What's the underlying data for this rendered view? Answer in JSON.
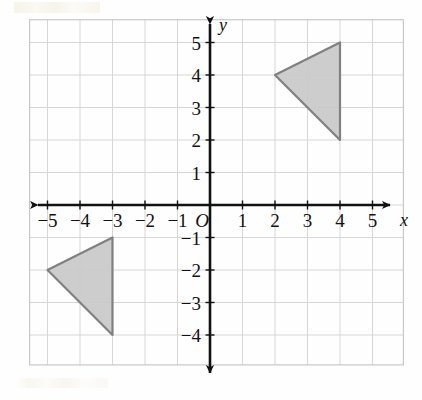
{
  "figure": {
    "type": "coordinate-grid"
  },
  "chart_data": {
    "type": "scatter",
    "title": "",
    "subtitle": "",
    "xlabel": "x",
    "ylabel": "y",
    "origin_label": "O",
    "xlim": [
      -5.5,
      5.8
    ],
    "ylim": [
      -4.9,
      5.6
    ],
    "grid": true,
    "grid_step": 1,
    "legend": null,
    "x_ticks": [
      -5,
      -4,
      -3,
      -2,
      -1,
      1,
      2,
      3,
      4,
      5
    ],
    "y_ticks": [
      5,
      4,
      3,
      2,
      1,
      -1,
      -2,
      -3,
      -4
    ],
    "x_tick_labels": [
      "−5",
      "−4",
      "−3",
      "−2",
      "−1",
      "1",
      "2",
      "3",
      "4",
      "5"
    ],
    "y_tick_labels": [
      "5",
      "4",
      "3",
      "2",
      "1",
      "−1",
      "−2",
      "−3",
      "−4"
    ],
    "axis_arrows": [
      "left",
      "right",
      "up",
      "down"
    ],
    "series": [
      {
        "name": "upper-right-triangle",
        "type": "polygon",
        "fill": "#c9c9c9",
        "stroke": "#808080",
        "points": [
          [
            2,
            4
          ],
          [
            4,
            5
          ],
          [
            4,
            2
          ]
        ]
      },
      {
        "name": "lower-left-triangle",
        "type": "polygon",
        "fill": "#c9c9c9",
        "stroke": "#808080",
        "points": [
          [
            -5,
            -2
          ],
          [
            -3,
            -1
          ],
          [
            -3,
            -4
          ]
        ]
      }
    ]
  },
  "style": {
    "axis_color": "#111111",
    "grid_color": "#d6d6d6",
    "grid_major_color": "#c4c4c4",
    "background": "#fefefe",
    "shape_fill": "#c9c9c9",
    "shape_stroke": "#808080"
  }
}
